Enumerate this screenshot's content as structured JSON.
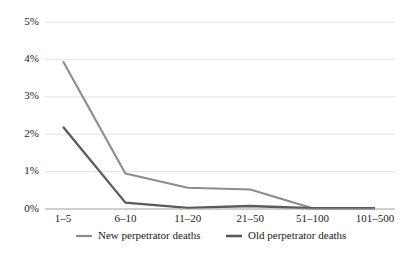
{
  "chart_data": {
    "type": "line",
    "title": "",
    "subtitle": "",
    "xlabel": "",
    "ylabel": "",
    "categories": [
      "1–5",
      "6–10",
      "11–20",
      "21–50",
      "51–100",
      "101–500"
    ],
    "series": [
      {
        "name": "New perpetrator deaths",
        "color": "#8c8c8c",
        "values": [
          3.95,
          0.95,
          0.57,
          0.52,
          0.02,
          0.02
        ]
      },
      {
        "name": "Old perpetrator deaths",
        "color": "#5a5a5a",
        "values": [
          2.2,
          0.17,
          0.03,
          0.08,
          0.02,
          0.02
        ]
      }
    ],
    "ylim": [
      0,
      5
    ],
    "ytick_values": [
      0,
      1,
      2,
      3,
      4,
      5
    ],
    "ytick_labels": [
      "0%",
      "1%",
      "2%",
      "3%",
      "4%",
      "5%"
    ],
    "grid": true,
    "grid_axis": "y",
    "grid_color": "#d9d9d9",
    "axis_color": "#a6a6a6",
    "legend_position": "bottom",
    "background": "#ffffff"
  },
  "axis": {
    "y_labels": [
      "5%",
      "4%",
      "3%",
      "2%",
      "1%",
      "0%"
    ],
    "x_labels": [
      "1–5",
      "6–10",
      "11–20",
      "21–50",
      "51–100",
      "101–500"
    ]
  },
  "legend": {
    "entries": [
      {
        "label": "New perpetrator deaths",
        "color": "#8c8c8c"
      },
      {
        "label": "Old perpetrator deaths",
        "color": "#5a5a5a"
      }
    ]
  }
}
